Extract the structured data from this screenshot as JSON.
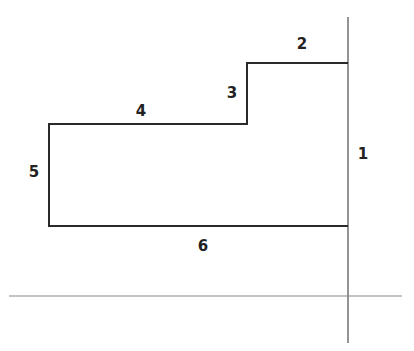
{
  "diagram": {
    "type": "floor-plan-outline",
    "colors": {
      "shape_stroke": "#2a2a2a",
      "axis_stroke": "#7a7a7a",
      "label": "#222222"
    },
    "shape_points": "348,63 247,63 247,124 49,124 49,226 348,226",
    "axes": {
      "vertical": {
        "x": 348,
        "y1": 17,
        "y2": 343
      },
      "horizontal": {
        "y": 296,
        "x1": 9,
        "x2": 402
      }
    },
    "edge_labels": [
      {
        "id": "1",
        "text": "1",
        "x": 363,
        "y": 154
      },
      {
        "id": "2",
        "text": "2",
        "x": 302,
        "y": 44
      },
      {
        "id": "3",
        "text": "3",
        "x": 232,
        "y": 93
      },
      {
        "id": "4",
        "text": "4",
        "x": 141,
        "y": 111
      },
      {
        "id": "5",
        "text": "5",
        "x": 34,
        "y": 172
      },
      {
        "id": "6",
        "text": "6",
        "x": 203,
        "y": 246
      }
    ]
  }
}
